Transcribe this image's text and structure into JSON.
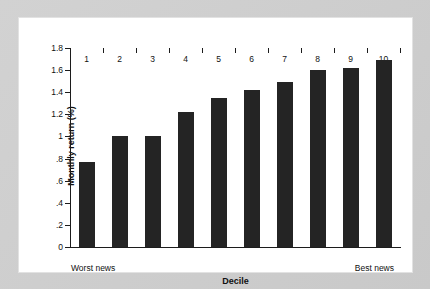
{
  "chart_data": {
    "type": "bar",
    "title": "",
    "subtitle": "",
    "xlabel": "Decile",
    "ylabel": "Monthly return (%)",
    "categories": [
      "1",
      "2",
      "3",
      "4",
      "5",
      "6",
      "7",
      "8",
      "9",
      "10"
    ],
    "values": [
      0.77,
      1.0,
      1.0,
      1.22,
      1.35,
      1.42,
      1.49,
      1.6,
      1.62,
      1.69
    ],
    "ylim": [
      0,
      1.8
    ],
    "ytick_labels": [
      "1.8",
      "1.6",
      "1.4",
      "1.2",
      "1",
      ".8",
      ".6",
      ".4",
      ".2",
      "0"
    ],
    "ytick_values": [
      1.8,
      1.6,
      1.4,
      1.2,
      1.0,
      0.8,
      0.6,
      0.4,
      0.2,
      0.0
    ],
    "grid": false,
    "legend": null,
    "legend_position": "none",
    "bar_color": "#242424",
    "axis_color": "#1c1c1c",
    "background_color": "#ffffff",
    "annotations": {
      "left_end": "Worst news",
      "right_end": "Best news"
    }
  },
  "page": {
    "background_color": "#cfcfcf",
    "panel_color": "#ffffff"
  }
}
